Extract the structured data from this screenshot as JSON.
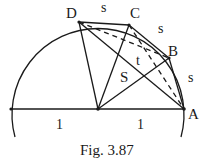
{
  "figure": {
    "caption": "Fig. 3.87",
    "points": {
      "D": {
        "label": "D"
      },
      "C": {
        "label": "C"
      },
      "B": {
        "label": "B"
      },
      "A": {
        "label": "A"
      }
    },
    "arc_labels": {
      "DC": "s",
      "CB": "s",
      "BA": "s"
    },
    "region_labels": {
      "S": "S",
      "t": "t"
    },
    "radius_labels": {
      "left": "1",
      "right": "1"
    },
    "colors": {
      "ink": "#1a1a1a",
      "background": "#ffffff"
    }
  }
}
